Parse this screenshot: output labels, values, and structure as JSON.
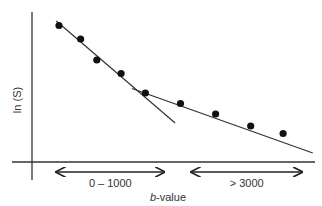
{
  "chart_data": {
    "type": "scatter",
    "title": "",
    "xlabel_italic": "b",
    "xlabel_rest": "-value",
    "ylabel": "ln (S)",
    "x_range": [
      0,
      10
    ],
    "y_range": [
      0,
      10
    ],
    "grid": false,
    "points": [
      {
        "x": 1.0,
        "y": 9.1
      },
      {
        "x": 1.8,
        "y": 8.2
      },
      {
        "x": 2.4,
        "y": 6.8
      },
      {
        "x": 3.3,
        "y": 5.9
      },
      {
        "x": 4.2,
        "y": 4.6
      },
      {
        "x": 5.5,
        "y": 3.9
      },
      {
        "x": 6.8,
        "y": 3.2
      },
      {
        "x": 8.1,
        "y": 2.4
      },
      {
        "x": 9.3,
        "y": 1.9
      }
    ],
    "fit_lines": [
      {
        "name": "low-b-fit",
        "x1": 0.9,
        "y1": 9.4,
        "x2": 5.3,
        "y2": 2.6
      },
      {
        "name": "high-b-fit",
        "x1": 3.7,
        "y1": 4.9,
        "x2": 10.4,
        "y2": 0.6
      }
    ],
    "ranges": [
      {
        "label": "0 – 1000",
        "x_start": 0.9,
        "x_end": 4.9
      },
      {
        "label": "> 3000",
        "x_start": 5.9,
        "x_end": 10.0
      }
    ]
  }
}
